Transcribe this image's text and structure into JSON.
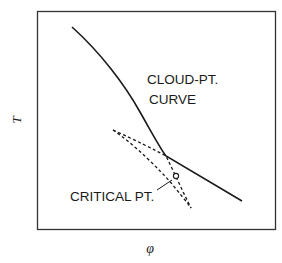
{
  "diagram": {
    "type": "phase-diagram",
    "axes": {
      "x_label": "φ",
      "y_label": "T"
    },
    "annotations": {
      "cloud_point_line1": "CLOUD-PT.",
      "cloud_point_line2": "CURVE",
      "critical_point": "CRITICAL PT."
    },
    "elements": [
      {
        "name": "cloud-point-curve",
        "style": "solid"
      },
      {
        "name": "upper-dashed-branch",
        "style": "dashed"
      },
      {
        "name": "lower-dashed-branch",
        "style": "dashed"
      },
      {
        "name": "critical-point-marker",
        "style": "open-circle"
      }
    ],
    "colors": {
      "line": "#1a1a1a",
      "background": "#ffffff"
    }
  }
}
